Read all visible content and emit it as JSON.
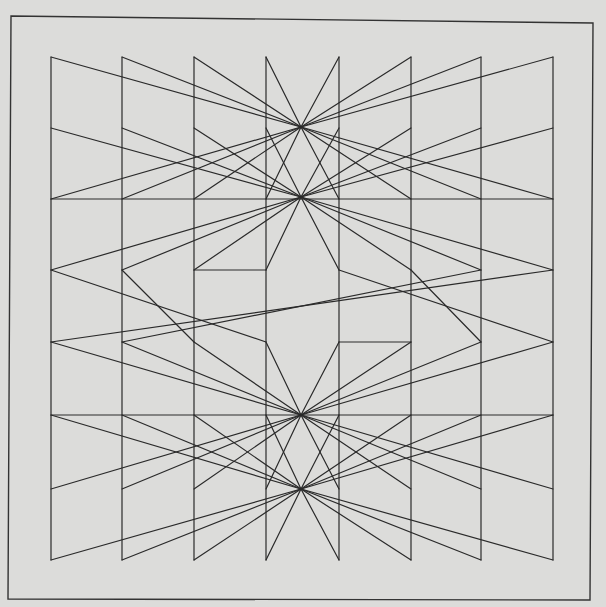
{
  "artwork": {
    "background": "#dcdcda",
    "stroke": "#2a2a2a",
    "frame": [
      [
        11,
        16
      ],
      [
        593,
        23
      ],
      [
        590,
        600
      ],
      [
        8,
        599
      ]
    ],
    "columns_x": [
      51,
      122,
      194,
      266,
      339,
      411,
      481,
      553
    ],
    "rows_y": [
      57,
      128,
      199,
      270,
      342,
      415,
      489,
      560
    ],
    "hubs": [
      [
        301,
        127
      ],
      [
        301,
        197
      ],
      [
        301,
        415
      ],
      [
        301,
        489
      ]
    ],
    "lines": [
      [
        51,
        57,
        51,
        560
      ],
      [
        122,
        57,
        122,
        560
      ],
      [
        194,
        57,
        194,
        560
      ],
      [
        266,
        57,
        266,
        560
      ],
      [
        339,
        57,
        339,
        560
      ],
      [
        411,
        57,
        411,
        560
      ],
      [
        481,
        57,
        481,
        560
      ],
      [
        553,
        57,
        553,
        560
      ],
      [
        51,
        199,
        553,
        199
      ],
      [
        51,
        415,
        553,
        415
      ],
      [
        194,
        270,
        266,
        270
      ],
      [
        339,
        342,
        411,
        342
      ],
      [
        51,
        57,
        301,
        127
      ],
      [
        122,
        57,
        301,
        127
      ],
      [
        194,
        57,
        301,
        127
      ],
      [
        266,
        57,
        301,
        127
      ],
      [
        339,
        57,
        301,
        127
      ],
      [
        411,
        57,
        301,
        127
      ],
      [
        481,
        57,
        301,
        127
      ],
      [
        553,
        57,
        301,
        127
      ],
      [
        51,
        128,
        301,
        197
      ],
      [
        122,
        128,
        301,
        197
      ],
      [
        194,
        128,
        301,
        197
      ],
      [
        266,
        128,
        301,
        197
      ],
      [
        339,
        128,
        301,
        197
      ],
      [
        411,
        128,
        301,
        197
      ],
      [
        481,
        128,
        301,
        197
      ],
      [
        553,
        128,
        301,
        197
      ],
      [
        51,
        199,
        301,
        127
      ],
      [
        122,
        199,
        301,
        127
      ],
      [
        194,
        199,
        301,
        127
      ],
      [
        266,
        199,
        301,
        127
      ],
      [
        339,
        199,
        301,
        127
      ],
      [
        411,
        199,
        301,
        127
      ],
      [
        481,
        199,
        301,
        127
      ],
      [
        553,
        199,
        301,
        127
      ],
      [
        51,
        270,
        301,
        197
      ],
      [
        122,
        270,
        301,
        197
      ],
      [
        194,
        270,
        301,
        197
      ],
      [
        266,
        270,
        301,
        197
      ],
      [
        339,
        270,
        301,
        197
      ],
      [
        411,
        270,
        301,
        197
      ],
      [
        481,
        270,
        301,
        197
      ],
      [
        553,
        270,
        301,
        197
      ],
      [
        51,
        270,
        266,
        342
      ],
      [
        122,
        270,
        194,
        342
      ],
      [
        339,
        270,
        553,
        342
      ],
      [
        411,
        270,
        481,
        342
      ],
      [
        51,
        342,
        553,
        270
      ],
      [
        122,
        342,
        481,
        270
      ],
      [
        51,
        342,
        301,
        415
      ],
      [
        122,
        342,
        301,
        415
      ],
      [
        194,
        342,
        301,
        415
      ],
      [
        266,
        342,
        301,
        415
      ],
      [
        339,
        342,
        301,
        415
      ],
      [
        411,
        342,
        301,
        415
      ],
      [
        481,
        342,
        301,
        415
      ],
      [
        553,
        342,
        301,
        415
      ],
      [
        51,
        415,
        301,
        489
      ],
      [
        122,
        415,
        301,
        489
      ],
      [
        194,
        415,
        301,
        489
      ],
      [
        266,
        415,
        301,
        489
      ],
      [
        339,
        415,
        301,
        489
      ],
      [
        411,
        415,
        301,
        489
      ],
      [
        481,
        415,
        301,
        489
      ],
      [
        553,
        415,
        301,
        489
      ],
      [
        51,
        489,
        301,
        415
      ],
      [
        122,
        489,
        301,
        415
      ],
      [
        194,
        489,
        301,
        415
      ],
      [
        266,
        489,
        301,
        415
      ],
      [
        339,
        489,
        301,
        415
      ],
      [
        411,
        489,
        301,
        415
      ],
      [
        481,
        489,
        301,
        415
      ],
      [
        553,
        489,
        301,
        415
      ],
      [
        51,
        560,
        301,
        489
      ],
      [
        122,
        560,
        301,
        489
      ],
      [
        194,
        560,
        301,
        489
      ],
      [
        266,
        560,
        301,
        489
      ],
      [
        339,
        560,
        301,
        489
      ],
      [
        411,
        560,
        301,
        489
      ],
      [
        481,
        560,
        301,
        489
      ],
      [
        553,
        560,
        301,
        489
      ]
    ]
  }
}
